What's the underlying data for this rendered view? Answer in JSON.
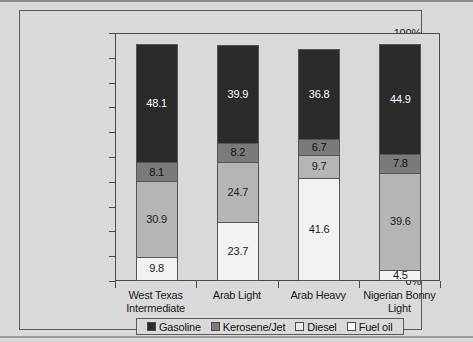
{
  "chart_data": {
    "type": "bar",
    "subtype": "stacked-100-percent",
    "title": "",
    "xlabel": "",
    "ylabel": "",
    "ylim": [
      0,
      100
    ],
    "ytick_labels": [
      "0%",
      "10%",
      "20%",
      "30%",
      "40%",
      "50%",
      "60%",
      "70%",
      "80%",
      "90%",
      "100%"
    ],
    "ytick_values": [
      0,
      10,
      20,
      30,
      40,
      50,
      60,
      70,
      80,
      90,
      100
    ],
    "grid": false,
    "legend_position": "bottom",
    "categories": [
      "West Texas Intermediate",
      "Arab Light",
      "Arab Heavy",
      "Nigerian Bonny Light"
    ],
    "category_lines": [
      [
        "West Texas",
        "Intermediate"
      ],
      [
        "Arab Light"
      ],
      [
        "Arab Heavy"
      ],
      [
        "Nigerian Bonny",
        "Light"
      ]
    ],
    "series": [
      {
        "name": "Fuel oil",
        "color": "#f2f2f2",
        "label_color": "#1a1a1a",
        "values": [
          9.8,
          23.7,
          41.6,
          4.5
        ]
      },
      {
        "name": "Diesel",
        "color": "#b5b5b5",
        "label_color": "#1a1a1a",
        "values": [
          30.9,
          24.7,
          9.7,
          39.6
        ]
      },
      {
        "name": "Kerosene/Jet",
        "color": "#7a7a7a",
        "label_color": "#111111",
        "values": [
          8.1,
          8.2,
          6.7,
          7.8
        ]
      },
      {
        "name": "Gasoline",
        "color": "#2b2b2b",
        "label_color": "#ffffff",
        "values": [
          48.1,
          39.9,
          36.8,
          44.9
        ]
      }
    ],
    "legend": [
      {
        "label": "Gasoline",
        "color": "#2b2b2b"
      },
      {
        "label": "Kerosene/Jet",
        "color": "#7a7a7a"
      },
      {
        "label": "Diesel",
        "color": "#e8e8e8"
      },
      {
        "label": "Fuel oil",
        "color": "#fbfbfb"
      }
    ]
  },
  "colors": {
    "page_background": "#d9d9d9",
    "frame_border": "#5a5a5a",
    "axis": "#4a4a4a",
    "text": "#1a1a1a"
  }
}
